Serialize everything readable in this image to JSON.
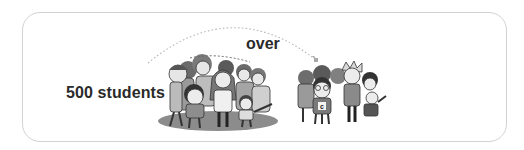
{
  "illustration": {
    "source_label": "500 students",
    "arrow_label": "over",
    "large_group": {
      "description": "large crowd of cartoon students",
      "shadow_color": "#8c8c8c"
    },
    "small_group": {
      "description": "small group of cartoon students",
      "shirt_letter": "c"
    },
    "colors": {
      "frame_border": "#d2d2d2",
      "text": "#2a2a2a",
      "arc": "#b8b8b8",
      "figure_dark": "#4a4a4a",
      "figure_mid": "#8a8a8a",
      "figure_light": "#d8d8d8"
    }
  }
}
